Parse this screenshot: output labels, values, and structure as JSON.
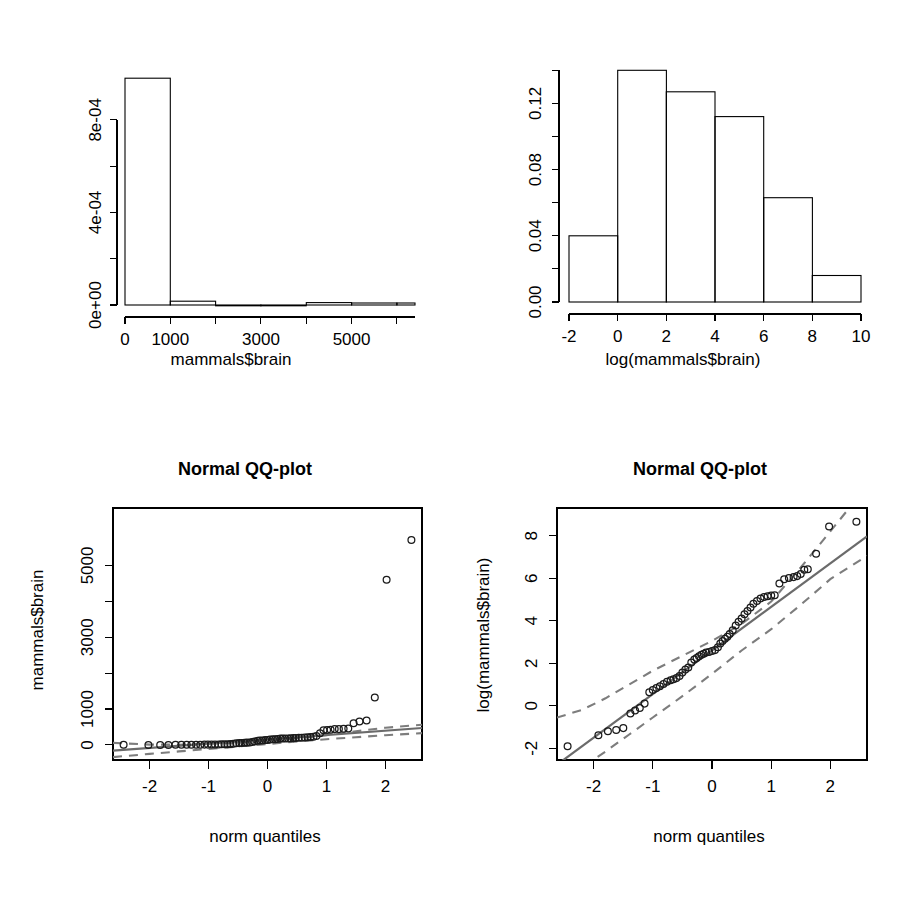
{
  "page": {
    "width": 923,
    "height": 904,
    "background": "#ffffff",
    "layout": "2x2 grid of R base-graphics plots"
  },
  "colors": {
    "foreground": "#000000",
    "point_stroke": "#1a1a1a",
    "reference_line": "#6b6b6b",
    "confidence_band": "#7d7d7d",
    "background": "#ffffff"
  },
  "chart_data": [
    {
      "id": "hist-brain",
      "type": "bar",
      "subtype": "histogram",
      "title": "",
      "xlabel": "mammals$brain",
      "ylabel": "",
      "xlim": [
        0,
        6400
      ],
      "ylim": [
        0,
        0.00105
      ],
      "grid": false,
      "legend": null,
      "xticks": [
        0,
        1000,
        2000,
        3000,
        4000,
        5000,
        6000
      ],
      "xticklabels": [
        "0",
        "1000",
        "",
        "3000",
        "",
        "5000",
        ""
      ],
      "yticks": [
        0,
        0.0002,
        0.0004,
        0.0006,
        0.0008
      ],
      "yticklabels": [
        "0e+00",
        "",
        "4e-04",
        "",
        "8e-04"
      ],
      "bin_edges": [
        0,
        1000,
        2000,
        3000,
        4000,
        5000,
        6000,
        6400
      ],
      "densities": [
        0.00098,
        1.65e-05,
        0.0,
        0.0,
        1.05e-05,
        8.5e-06,
        8.5e-06
      ],
      "categories": [
        "0-1000",
        "1000-2000",
        "2000-3000",
        "3000-4000",
        "4000-5000",
        "5000-6000",
        "6000-6400"
      ],
      "values": [
        0.00098,
        1.65e-05,
        0.0,
        0.0,
        1.05e-05,
        8.5e-06,
        8.5e-06
      ]
    },
    {
      "id": "hist-log-brain",
      "type": "bar",
      "subtype": "histogram",
      "title": "",
      "xlabel": "log(mammals$brain)",
      "ylabel": "",
      "xlim": [
        -2,
        10
      ],
      "ylim": [
        0,
        0.145
      ],
      "grid": false,
      "legend": null,
      "xticks": [
        -2,
        0,
        2,
        4,
        6,
        8,
        10
      ],
      "xticklabels": [
        "-2",
        "0",
        "2",
        "4",
        "6",
        "8",
        "10"
      ],
      "yticks": [
        0.0,
        0.02,
        0.04,
        0.06,
        0.08,
        0.1,
        0.12,
        0.14
      ],
      "yticklabels": [
        "0.00",
        "",
        "0.04",
        "",
        "0.08",
        "",
        "0.12",
        ""
      ],
      "bin_edges": [
        -2,
        0,
        2,
        4,
        6,
        8,
        10
      ],
      "densities": [
        0.04,
        0.14,
        0.127,
        0.112,
        0.063,
        0.016
      ],
      "categories": [
        "-2-0",
        "0-2",
        "2-4",
        "4-6",
        "6-8",
        "8-10"
      ],
      "values": [
        0.04,
        0.14,
        0.127,
        0.112,
        0.063,
        0.016
      ]
    },
    {
      "id": "qq-brain",
      "type": "scatter",
      "subtype": "qq-plot",
      "title": "Normal QQ-plot",
      "xlabel": "norm quantiles",
      "ylabel": "mammals$brain",
      "xlim": [
        -2.62,
        2.62
      ],
      "ylim": [
        -420,
        6600
      ],
      "grid": false,
      "legend": null,
      "xticks": [
        -2,
        -1,
        0,
        1,
        2
      ],
      "xticklabels": [
        "-2",
        "-1",
        "0",
        "1",
        "2"
      ],
      "yticks": [
        0,
        1000,
        2000,
        3000,
        4000,
        5000
      ],
      "yticklabels": [
        "0",
        "1000",
        "",
        "3000",
        "",
        "5000"
      ],
      "reference_line": {
        "intercept": 157,
        "slope": 120
      },
      "band_upper": [
        [
          -2.62,
          55
        ],
        [
          -2.0,
          10
        ],
        [
          -1.5,
          5
        ],
        [
          -1.0,
          30
        ],
        [
          -0.5,
          70
        ],
        [
          0.0,
          120
        ],
        [
          0.5,
          185
        ],
        [
          1.0,
          270
        ],
        [
          1.5,
          380
        ],
        [
          2.0,
          480
        ],
        [
          2.62,
          560
        ]
      ],
      "band_lower": [
        [
          -2.62,
          -340
        ],
        [
          -2.0,
          -250
        ],
        [
          -1.5,
          -180
        ],
        [
          -1.0,
          -110
        ],
        [
          -0.5,
          -45
        ],
        [
          0.0,
          25
        ],
        [
          0.5,
          95
        ],
        [
          1.0,
          160
        ],
        [
          1.5,
          215
        ],
        [
          2.0,
          270
        ],
        [
          2.62,
          330
        ]
      ],
      "points": [
        [
          -2.44,
          4.0
        ],
        [
          -2.02,
          1.0
        ],
        [
          -1.82,
          0.4
        ],
        [
          -1.68,
          1.2
        ],
        [
          -1.56,
          2.5
        ],
        [
          -1.46,
          3.0
        ],
        [
          -1.37,
          4.0
        ],
        [
          -1.29,
          4.5
        ],
        [
          -1.21,
          5.5
        ],
        [
          -1.14,
          6.3
        ],
        [
          -1.07,
          10.0
        ],
        [
          -1.01,
          10.0
        ],
        [
          -0.95,
          12.3
        ],
        [
          -0.89,
          12.5
        ],
        [
          -0.83,
          14.0
        ],
        [
          -0.78,
          17.0
        ],
        [
          -0.73,
          17.5
        ],
        [
          -0.68,
          21.0
        ],
        [
          -0.63,
          25.0
        ],
        [
          -0.58,
          35.0
        ],
        [
          -0.53,
          44.5
        ],
        [
          -0.48,
          50.0
        ],
        [
          -0.44,
          56.0
        ],
        [
          -0.39,
          60.0
        ],
        [
          -0.35,
          64.0
        ],
        [
          -0.3,
          68.0
        ],
        [
          -0.26,
          81.0
        ],
        [
          -0.22,
          98.2
        ],
        [
          -0.17,
          115.0
        ],
        [
          -0.13,
          119.5
        ],
        [
          -0.09,
          123.0
        ],
        [
          -0.04,
          133.0
        ],
        [
          0.0,
          140.0
        ],
        [
          0.04,
          148.0
        ],
        [
          0.09,
          157.0
        ],
        [
          0.13,
          160.0
        ],
        [
          0.17,
          169.0
        ],
        [
          0.22,
          175.0
        ],
        [
          0.26,
          179.5
        ],
        [
          0.3,
          180.0
        ],
        [
          0.35,
          181.0
        ],
        [
          0.39,
          187.0
        ],
        [
          0.44,
          190.0
        ],
        [
          0.48,
          196.0
        ],
        [
          0.53,
          198.0
        ],
        [
          0.58,
          200.0
        ],
        [
          0.63,
          207.0
        ],
        [
          0.68,
          212.0
        ],
        [
          0.73,
          220.0
        ],
        [
          0.78,
          230.0
        ],
        [
          0.83,
          250.0
        ],
        [
          0.89,
          325.0
        ],
        [
          0.95,
          406.0
        ],
        [
          1.01,
          419.0
        ],
        [
          1.07,
          423.0
        ],
        [
          1.14,
          440.0
        ],
        [
          1.21,
          440.0
        ],
        [
          1.29,
          450.0
        ],
        [
          1.37,
          460.0
        ],
        [
          1.46,
          603.0
        ],
        [
          1.56,
          655.0
        ],
        [
          1.68,
          680.0
        ],
        [
          1.82,
          1320.0
        ],
        [
          2.02,
          4603.0
        ],
        [
          2.44,
          5712.0
        ]
      ]
    },
    {
      "id": "qq-log-brain",
      "type": "scatter",
      "subtype": "qq-plot",
      "title": "Normal QQ-plot",
      "xlabel": "norm quantiles",
      "ylabel": "log(mammals$brain)",
      "xlim": [
        -2.62,
        2.62
      ],
      "ylim": [
        -2.55,
        9.3
      ],
      "grid": false,
      "legend": null,
      "xticks": [
        -2,
        -1,
        0,
        1,
        2
      ],
      "xticklabels": [
        "-2",
        "-1",
        "0",
        "1",
        "2"
      ],
      "yticks": [
        -2,
        0,
        2,
        4,
        6,
        8
      ],
      "yticklabels": [
        "-2",
        "0",
        "2",
        "4",
        "6",
        "8"
      ],
      "reference_line": {
        "intercept": 2.6,
        "slope": 2.05
      },
      "band_upper": [
        [
          -2.62,
          -0.55
        ],
        [
          -2.2,
          -0.2
        ],
        [
          -1.8,
          0.35
        ],
        [
          -1.4,
          1.0
        ],
        [
          -1.0,
          1.65
        ],
        [
          -0.5,
          2.35
        ],
        [
          0.0,
          3.05
        ],
        [
          0.5,
          3.85
        ],
        [
          1.0,
          4.9
        ],
        [
          1.5,
          6.5
        ],
        [
          2.0,
          8.2
        ],
        [
          2.35,
          9.4
        ]
      ],
      "band_lower": [
        [
          -2.62,
          -3.6
        ],
        [
          -2.2,
          -2.9
        ],
        [
          -1.8,
          -2.15
        ],
        [
          -1.4,
          -1.35
        ],
        [
          -1.0,
          -0.55
        ],
        [
          -0.5,
          0.45
        ],
        [
          0.0,
          1.5
        ],
        [
          0.5,
          2.6
        ],
        [
          1.0,
          3.6
        ],
        [
          1.5,
          4.75
        ],
        [
          2.0,
          5.95
        ],
        [
          2.62,
          7.05
        ]
      ],
      "points": [
        [
          -2.44,
          -1.9
        ],
        [
          -1.92,
          -1.39
        ],
        [
          -1.76,
          -1.2
        ],
        [
          -1.62,
          -1.14
        ],
        [
          -1.5,
          -1.05
        ],
        [
          -1.38,
          -0.36
        ],
        [
          -1.3,
          -0.22
        ],
        [
          -1.22,
          -0.1
        ],
        [
          -1.14,
          0.1
        ],
        [
          -1.06,
          0.64
        ],
        [
          -1.0,
          0.74
        ],
        [
          -0.94,
          0.83
        ],
        [
          -0.88,
          0.92
        ],
        [
          -0.82,
          1.03
        ],
        [
          -0.76,
          1.13
        ],
        [
          -0.7,
          1.2
        ],
        [
          -0.65,
          1.25
        ],
        [
          -0.6,
          1.3
        ],
        [
          -0.55,
          1.4
        ],
        [
          -0.5,
          1.56
        ],
        [
          -0.45,
          1.7
        ],
        [
          -0.4,
          1.8
        ],
        [
          -0.35,
          2.03
        ],
        [
          -0.3,
          2.17
        ],
        [
          -0.26,
          2.25
        ],
        [
          -0.22,
          2.33
        ],
        [
          -0.18,
          2.4
        ],
        [
          -0.14,
          2.45
        ],
        [
          -0.1,
          2.5
        ],
        [
          -0.05,
          2.53
        ],
        [
          0.0,
          2.58
        ],
        [
          0.05,
          2.62
        ],
        [
          0.1,
          2.75
        ],
        [
          0.14,
          2.93
        ],
        [
          0.18,
          3.05
        ],
        [
          0.22,
          3.15
        ],
        [
          0.26,
          3.25
        ],
        [
          0.3,
          3.37
        ],
        [
          0.35,
          3.55
        ],
        [
          0.4,
          3.78
        ],
        [
          0.45,
          3.95
        ],
        [
          0.5,
          4.1
        ],
        [
          0.55,
          4.3
        ],
        [
          0.6,
          4.45
        ],
        [
          0.65,
          4.62
        ],
        [
          0.7,
          4.8
        ],
        [
          0.76,
          4.93
        ],
        [
          0.82,
          5.05
        ],
        [
          0.88,
          5.12
        ],
        [
          0.94,
          5.15
        ],
        [
          1.0,
          5.18
        ],
        [
          1.06,
          5.2
        ],
        [
          1.14,
          5.75
        ],
        [
          1.22,
          5.95
        ],
        [
          1.3,
          6.01
        ],
        [
          1.38,
          6.05
        ],
        [
          1.44,
          6.1
        ],
        [
          1.5,
          6.2
        ],
        [
          1.56,
          6.4
        ],
        [
          1.62,
          6.42
        ],
        [
          1.76,
          7.15
        ],
        [
          1.98,
          8.43
        ],
        [
          2.44,
          8.65
        ]
      ]
    }
  ],
  "panels": {
    "top_left": {
      "xlabel": "mammals$brain"
    },
    "top_right": {
      "xlabel": "log(mammals$brain)"
    },
    "bottom_left": {
      "title": "Normal QQ-plot",
      "xlabel": "norm quantiles",
      "ylabel": "mammals$brain"
    },
    "bottom_right": {
      "title": "Normal QQ-plot",
      "xlabel": "norm quantiles",
      "ylabel": "log(mammals$brain)"
    }
  }
}
